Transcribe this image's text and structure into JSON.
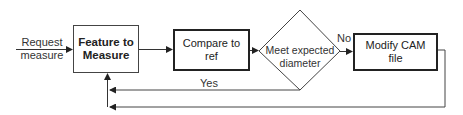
{
  "diagram": {
    "type": "flowchart",
    "input": {
      "label_line1": "Request",
      "label_line2": "measure"
    },
    "nodes": [
      {
        "id": "feature",
        "shape": "rect",
        "label_line1": "Feature to",
        "label_line2": "Measure",
        "style": "bold-text thin-border"
      },
      {
        "id": "compare",
        "shape": "rect",
        "label_line1": "Compare to",
        "label_line2": "ref",
        "style": "thick-border"
      },
      {
        "id": "decision",
        "shape": "diamond",
        "label_line1": "Meet expected",
        "label_line2": "diameter"
      },
      {
        "id": "modify",
        "shape": "rect",
        "label_line1": "Modify CAM",
        "label_line2": "file",
        "style": "thick-border"
      }
    ],
    "edges": [
      {
        "from": "input",
        "to": "feature"
      },
      {
        "from": "feature",
        "to": "compare"
      },
      {
        "from": "compare",
        "to": "decision"
      },
      {
        "from": "decision",
        "to": "modify",
        "label": "No"
      },
      {
        "from": "decision",
        "to": "feature",
        "label": "Yes"
      },
      {
        "from": "modify",
        "to": "feature"
      }
    ],
    "edge_labels": {
      "no": "No",
      "yes": "Yes"
    }
  }
}
